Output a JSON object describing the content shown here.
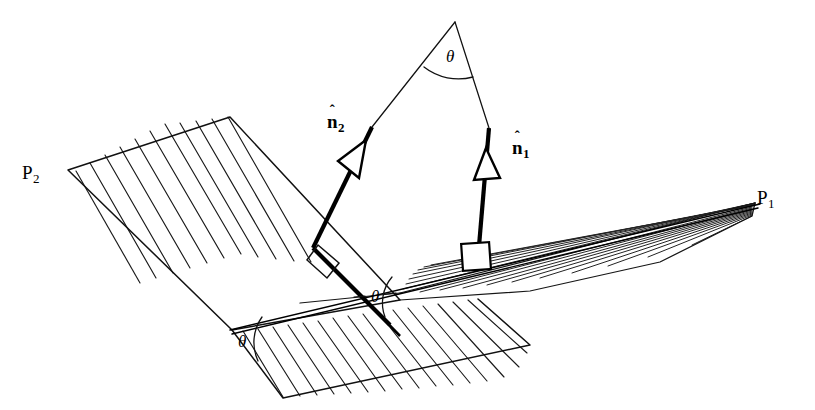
{
  "figure": {
    "width": 815,
    "height": 410,
    "background_color": "#ffffff",
    "ink_color": "#000000",
    "style": "line drawing with parallel hatching"
  },
  "planes": [
    {
      "id": "P1",
      "label": "P",
      "subscript": "1",
      "label_x": 757,
      "label_y": 188,
      "description": "right-hand plane seen nearly edge-on, converging to a point at right"
    },
    {
      "id": "P2",
      "label": "P",
      "subscript": "2",
      "label_x": 22,
      "label_y": 163,
      "description": "left-hand hatched plane tilted up to the left"
    }
  ],
  "normals": [
    {
      "id": "n1",
      "label": "n",
      "subscript": "1",
      "accent": "hat",
      "label_x": 512,
      "label_y": 138,
      "description": "unit normal to plane P1, rises from right-angle marker on P1 to the apex"
    },
    {
      "id": "n2",
      "label": "n",
      "subscript": "2",
      "accent": "hat",
      "label_x": 327,
      "label_y": 112,
      "description": "unit normal to plane P2, rises from right-angle marker on P2 to the apex"
    }
  ],
  "angles": [
    {
      "id": "theta-apex",
      "symbol": "θ",
      "x": 446,
      "y": 48,
      "description": "angle between the two unit normals at the apex"
    },
    {
      "id": "theta-intersection",
      "symbol": "θ",
      "x": 371,
      "y": 296,
      "description": "dihedral angle measured at the line of intersection"
    },
    {
      "id": "theta-front-edge",
      "symbol": "θ",
      "x": 238,
      "y": 341,
      "description": "dihedral angle repeated at the front edge of the planes"
    }
  ],
  "markers": [
    {
      "id": "right-angle-n1",
      "type": "right-angle-square",
      "x": 478,
      "y": 258,
      "description": "perpendicularity marker where n1 meets plane P1"
    },
    {
      "id": "right-angle-n2",
      "type": "right-angle-square",
      "x": 317,
      "y": 250,
      "description": "perpendicularity marker where n2 meets plane P2"
    },
    {
      "id": "arrowhead-n1",
      "type": "open-triangle-arrowhead",
      "x": 487,
      "y": 163
    },
    {
      "id": "arrowhead-n2",
      "type": "open-triangle-arrowhead",
      "x": 360,
      "y": 157
    }
  ],
  "apex": {
    "x": 455,
    "y": 22,
    "description": "point where the two normal directions meet"
  }
}
